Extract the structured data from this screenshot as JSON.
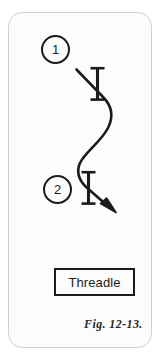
{
  "figure": {
    "kind": "instructional-diagram",
    "caption": "Fig. 12-13.",
    "background_color": "#fcfcfc",
    "ink_color": "#1b1b1b",
    "frame_color": "#cfcfcf"
  },
  "steps": [
    {
      "number": "1",
      "name": "step-marker-1"
    },
    {
      "number": "2",
      "name": "step-marker-2"
    }
  ],
  "label": {
    "text": "Threadle",
    "border_color": "#1b1b1b"
  },
  "symbols": {
    "needle_upper": "needle-bar-icon",
    "needle_lower": "needle-bar-icon",
    "thread_path": "s-curve-thread-path",
    "arrowhead": "arrowhead-icon"
  }
}
